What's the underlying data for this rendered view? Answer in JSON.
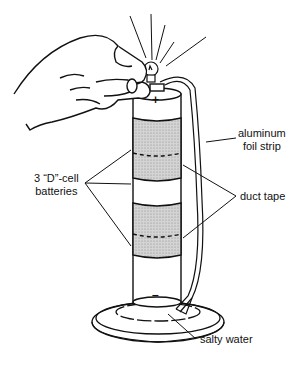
{
  "diagram": {
    "type": "illustration",
    "labels": {
      "foil_line1": "aluminum",
      "foil_line2": "foil strip",
      "batteries_line1": "3 “D”-cell",
      "batteries_line2": "batteries",
      "duct_tape": "duct tape",
      "salty_water": "salty water",
      "positive_terminal": "+",
      "negative_terminal": "–"
    },
    "colors": {
      "ink": "#111111",
      "tape_fill": "#c8c8c8",
      "background": "#ffffff"
    }
  }
}
